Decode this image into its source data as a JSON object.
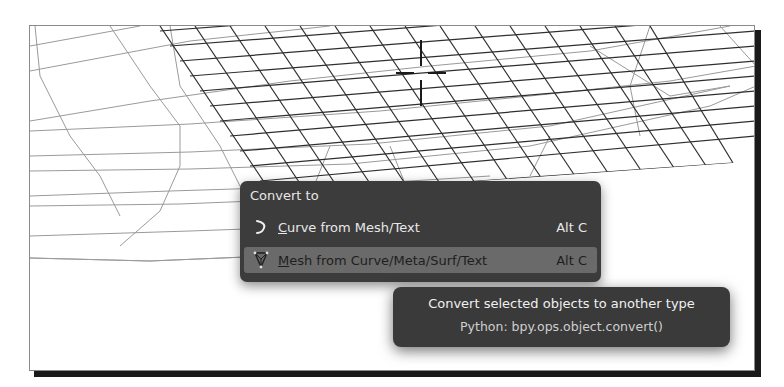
{
  "viewport": {
    "name": "3d-viewport",
    "cursor": {
      "x": 420,
      "y": 72
    }
  },
  "menu": {
    "title": "Convert to",
    "items": [
      {
        "icon": "curve-icon",
        "mnemonic": "C",
        "label_rest": "urve from Mesh/Text",
        "shortcut": "Alt C",
        "highlighted": false
      },
      {
        "icon": "mesh-icon",
        "mnemonic": "M",
        "label_rest": "esh from Curve/Meta/Surf/Text",
        "shortcut": "Alt C",
        "highlighted": true
      }
    ]
  },
  "tooltip": {
    "title": "Convert selected objects to another type",
    "python": "Python: bpy.ops.object.convert()"
  },
  "colors": {
    "menu_bg": "#3c3c3c",
    "menu_highlight": "#6a6a6a",
    "tooltip_bg": "#3a3a3a",
    "wire_dark": "#2e2e2e",
    "wire_light": "#9a9a9a"
  }
}
